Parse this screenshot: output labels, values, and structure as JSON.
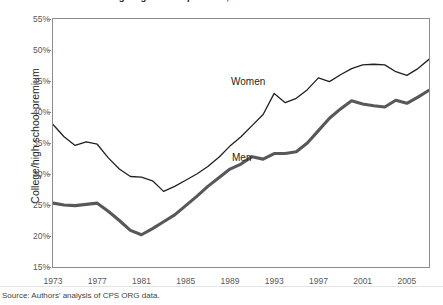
{
  "figure": {
    "title": "College/high school premium, 1973-2007",
    "title_note": "title is cropped at the top edge of the screenshot",
    "source": "Source: Authors' analysis of CPS ORG data.",
    "ylabel": "College/high school premium",
    "label_women": "Women",
    "label_men": "Men",
    "colors": {
      "women_line": "#231f20",
      "men_line": "#58585b",
      "axis": "#8c8c8c",
      "text": "#231f20",
      "tick_text": "#58585b",
      "background": "#ffffff"
    }
  },
  "chart_data": {
    "type": "line",
    "title": "College/high school premium, 1973-2007",
    "xlabel": "",
    "ylabel": "College/high school premium",
    "xlim": [
      1973,
      2007
    ],
    "ylim": [
      15,
      55
    ],
    "ytick_values": [
      15,
      20,
      25,
      30,
      35,
      40,
      45,
      50,
      55
    ],
    "ytick_labels": [
      "15%",
      "20%",
      "25%",
      "30%",
      "35%",
      "40%",
      "45%",
      "50%",
      "55%"
    ],
    "xtick_values": [
      1973,
      1977,
      1981,
      1985,
      1989,
      1993,
      1997,
      2001,
      2005
    ],
    "xtick_labels": [
      "1973",
      "1977",
      "1981",
      "1985",
      "1989",
      "1993",
      "1997",
      "2001",
      "2005"
    ],
    "grid": false,
    "legend": "inline-labels",
    "units": "percent",
    "x": [
      1973,
      1974,
      1975,
      1976,
      1977,
      1978,
      1979,
      1980,
      1981,
      1982,
      1983,
      1984,
      1985,
      1986,
      1987,
      1988,
      1989,
      1990,
      1991,
      1992,
      1993,
      1994,
      1995,
      1996,
      1997,
      1998,
      1999,
      2000,
      2001,
      2002,
      2003,
      2004,
      2005,
      2006,
      2007
    ],
    "series": [
      {
        "name": "Women",
        "style": "thin",
        "color": "#231f20",
        "values": [
          38.0,
          36.0,
          34.6,
          35.2,
          34.8,
          32.6,
          30.8,
          29.6,
          29.5,
          28.9,
          27.2,
          28.0,
          29.0,
          30.0,
          31.2,
          32.7,
          34.5,
          36.0,
          37.8,
          39.6,
          43.0,
          41.5,
          42.2,
          43.6,
          45.5,
          44.9,
          46.0,
          47.0,
          47.6,
          47.7,
          47.6,
          46.5,
          45.9,
          47.0,
          48.5
        ]
      },
      {
        "name": "Men",
        "style": "thick",
        "color": "#58585b",
        "values": [
          25.3,
          25.0,
          24.9,
          25.1,
          25.3,
          24.0,
          22.5,
          20.9,
          20.2,
          21.2,
          22.3,
          23.4,
          24.9,
          26.4,
          28.0,
          29.4,
          30.8,
          31.6,
          32.8,
          32.4,
          33.3,
          33.3,
          33.6,
          35.0,
          37.0,
          39.0,
          40.5,
          41.8,
          41.3,
          41.0,
          40.8,
          41.9,
          41.4,
          42.4,
          43.5
        ]
      }
    ]
  }
}
